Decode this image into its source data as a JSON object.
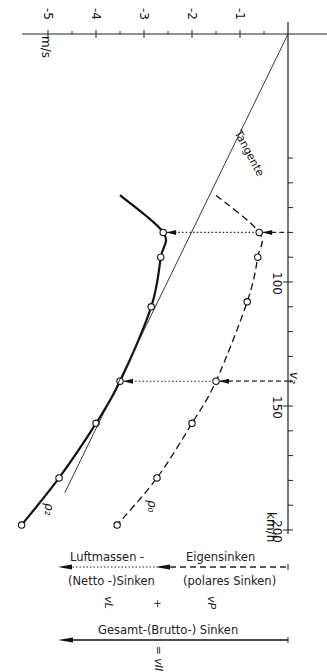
{
  "chart_data": {
    "type": "line",
    "orientation": "rotated-90-clockwise",
    "title": "",
    "xlabel": "km/h",
    "ylabel": "m/s",
    "x_axis_marker": "v₂",
    "x_ticks": [
      100,
      150,
      200
    ],
    "x_minor_step": 10,
    "xlim": [
      0,
      200
    ],
    "y_ticks": [
      -1,
      -2,
      -3,
      -4,
      -5
    ],
    "y_tick_labels": [
      "-1",
      "-2",
      "-3",
      "-4",
      "-5"
    ],
    "y_minor_step": 0.5,
    "ylim": [
      -5.5,
      0
    ],
    "grid": false,
    "series": [
      {
        "name": "ρ₂",
        "style": "solid-thick",
        "curve_start": {
          "x": 65,
          "y": -3.5
        },
        "x": [
          80,
          90,
          110,
          140,
          157,
          179,
          198
        ],
        "y": [
          -2.6,
          -2.65,
          -2.85,
          -3.5,
          -4.0,
          -4.77,
          -5.55
        ]
      },
      {
        "name": "ρ₀",
        "style": "dashed",
        "curve_start": {
          "x": 65,
          "y": -1.5
        },
        "x": [
          80,
          90,
          108,
          140,
          157,
          179,
          198
        ],
        "y": [
          -0.6,
          -0.63,
          -0.85,
          -1.5,
          -2.0,
          -2.73,
          -3.56
        ]
      },
      {
        "name": "Tangente",
        "style": "thin",
        "x": [
          0,
          185
        ],
        "y": [
          0,
          -4.65
        ]
      }
    ],
    "annotations": [
      {
        "text": "Tangente",
        "type": "line-label"
      },
      {
        "text": "v₂",
        "type": "axis-marker",
        "x": 140
      },
      {
        "type": "dotted-connector",
        "x": 80,
        "from_y": -2.6,
        "to_y": -0.6
      },
      {
        "type": "dotted-connector",
        "x": 140,
        "from_y": -3.5,
        "to_y": -1.5
      }
    ]
  },
  "axes": {
    "y_unit": "m/s",
    "x_unit": "km/h",
    "x_tick_labels": [
      "100",
      "150",
      "200"
    ],
    "v2_label": "v₂"
  },
  "curve_labels": {
    "rho2": "ρ₂",
    "rho0": "ρ₀",
    "tangent": "Tangente"
  },
  "legend": {
    "airmass_top": "Luftmassen -",
    "airmass_bottom": "(Netto -)Sinken",
    "own_top": "Eigensinken",
    "own_bottom": "(polares Sinken)",
    "total": "Gesamt-(Brutto-) Sinken",
    "sym_vl": "vL",
    "sym_plus": "+",
    "sym_vp": "vP",
    "sym_vii": "= vII"
  }
}
